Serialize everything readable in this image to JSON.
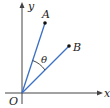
{
  "diagram": {
    "colors": {
      "axis": "#444444",
      "vector": "#3a6fc4",
      "point": "#111111",
      "label": "#222222"
    },
    "labels": {
      "origin": "O",
      "x_axis": "x",
      "y_axis": "y",
      "point_a": "A",
      "point_b": "B",
      "angle": "θ"
    },
    "points": {
      "origin": {
        "x": 22,
        "y": 93
      },
      "A": {
        "x": 45,
        "y": 23
      },
      "B": {
        "x": 69,
        "y": 46
      }
    }
  }
}
